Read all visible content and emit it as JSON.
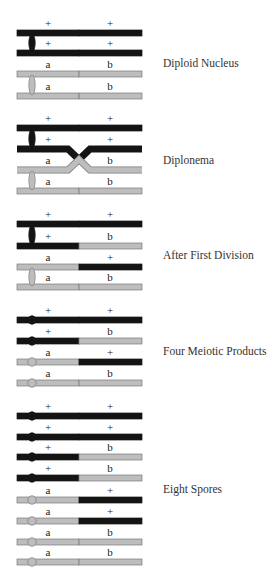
{
  "colors": {
    "dominant": "#141414",
    "recessive": "#bdbdbd",
    "recessive_border": "#7a7a7a",
    "label": "#333333"
  },
  "geometry": {
    "bar_x1": 17,
    "bar_x2": 142,
    "split_x": 79,
    "allele_left_x": 48,
    "allele_right_x": 110,
    "centromere_x": 32,
    "bar_height": 6
  },
  "stages": [
    {
      "name": "Diploid Nucleus",
      "label_y": 64,
      "centromere": "oval",
      "crossover": false,
      "chromatids": [
        {
          "y": 33,
          "left": "+",
          "right": "+",
          "left_color": "dominant",
          "right_color": "dominant",
          "pair": 0
        },
        {
          "y": 53,
          "left": "+",
          "right": "+",
          "left_color": "dominant",
          "right_color": "dominant",
          "pair": 0
        },
        {
          "y": 74,
          "left": "a",
          "right": "b",
          "left_color": "recessive",
          "right_color": "recessive",
          "pair": 1
        },
        {
          "y": 96,
          "left": "a",
          "right": "b",
          "left_color": "recessive",
          "right_color": "recessive",
          "pair": 1
        }
      ]
    },
    {
      "name": "Diplonema",
      "label_y": 161,
      "centromere": "oval",
      "crossover": true,
      "chromatids": [
        {
          "y": 128,
          "left": "+",
          "right": "+",
          "left_color": "dominant",
          "right_color": "dominant",
          "pair": 0
        },
        {
          "y": 149,
          "left": "+",
          "right": "+",
          "left_color": "dominant",
          "right_color": "dominant",
          "pair": 0
        },
        {
          "y": 170,
          "left": "a",
          "right": "b",
          "left_color": "recessive",
          "right_color": "recessive",
          "pair": 1
        },
        {
          "y": 191,
          "left": "a",
          "right": "b",
          "left_color": "recessive",
          "right_color": "recessive",
          "pair": 1
        }
      ]
    },
    {
      "name": "After First Division",
      "label_y": 256,
      "centromere": "oval",
      "crossover": false,
      "chromatids": [
        {
          "y": 224,
          "left": "+",
          "right": "+",
          "left_color": "dominant",
          "right_color": "dominant",
          "pair": 0
        },
        {
          "y": 246,
          "left": "+",
          "right": "b",
          "left_color": "dominant",
          "right_color": "recessive",
          "pair": 0
        },
        {
          "y": 267,
          "left": "a",
          "right": "+",
          "left_color": "recessive",
          "right_color": "dominant",
          "pair": 1
        },
        {
          "y": 287,
          "left": "a",
          "right": "b",
          "left_color": "recessive",
          "right_color": "recessive",
          "pair": 1
        }
      ]
    },
    {
      "name": "Four Meiotic Products",
      "label_y": 352,
      "centromere": "circle",
      "crossover": false,
      "chromatids": [
        {
          "y": 320,
          "left": "+",
          "right": "+",
          "left_color": "dominant",
          "right_color": "dominant"
        },
        {
          "y": 341,
          "left": "+",
          "right": "b",
          "left_color": "dominant",
          "right_color": "recessive"
        },
        {
          "y": 362,
          "left": "a",
          "right": "+",
          "left_color": "recessive",
          "right_color": "dominant"
        },
        {
          "y": 383,
          "left": "a",
          "right": "b",
          "left_color": "recessive",
          "right_color": "recessive"
        }
      ]
    },
    {
      "name": "Eight Spores",
      "label_y": 490,
      "centromere": "circle",
      "crossover": false,
      "chromatids": [
        {
          "y": 416,
          "left": "+",
          "right": "+",
          "left_color": "dominant",
          "right_color": "dominant"
        },
        {
          "y": 437,
          "left": "+",
          "right": "+",
          "left_color": "dominant",
          "right_color": "dominant"
        },
        {
          "y": 457,
          "left": "+",
          "right": "b",
          "left_color": "dominant",
          "right_color": "recessive"
        },
        {
          "y": 478,
          "left": "+",
          "right": "b",
          "left_color": "dominant",
          "right_color": "recessive"
        },
        {
          "y": 500,
          "left": "a",
          "right": "+",
          "left_color": "recessive",
          "right_color": "dominant"
        },
        {
          "y": 521,
          "left": "a",
          "right": "+",
          "left_color": "recessive",
          "right_color": "dominant"
        },
        {
          "y": 542,
          "left": "a",
          "right": "b",
          "left_color": "recessive",
          "right_color": "recessive"
        },
        {
          "y": 562,
          "left": "a",
          "right": "b",
          "left_color": "recessive",
          "right_color": "recessive"
        }
      ]
    }
  ]
}
